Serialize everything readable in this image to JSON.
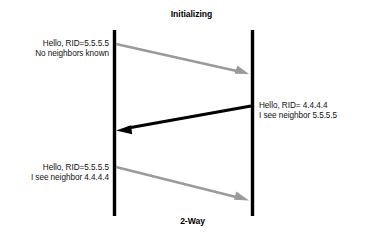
{
  "diagram": {
    "type": "sequence-diagram",
    "title_top": "Initializing",
    "title_bottom": "2-Way",
    "colors": {
      "lifeline": "#000000",
      "arrow_gray": "#9a9a9a",
      "arrow_black": "#000000",
      "background": "#ffffff",
      "text": "#111111"
    },
    "lifelines": [
      {
        "name": "left-router-lifeline",
        "x": 114,
        "y_top": 30,
        "y_bottom": 216
      },
      {
        "name": "right-router-lifeline",
        "x": 252,
        "y_top": 30,
        "y_bottom": 216
      }
    ],
    "messages": [
      {
        "id": "hello-1",
        "direction": "left-to-right",
        "color": "#9a9a9a",
        "label_lines": [
          "Hello, RID=5.5.5.5",
          "No neighbors known"
        ],
        "x1": 116,
        "y1": 44,
        "x2": 248,
        "y2": 74
      },
      {
        "id": "hello-2",
        "direction": "right-to-left",
        "color": "#000000",
        "label_lines": [
          "Hello, RID= 4.4.4.4",
          "I see neighbor 5.5.5.5"
        ],
        "x1": 251,
        "y1": 106,
        "x2": 118,
        "y2": 130
      },
      {
        "id": "hello-3",
        "direction": "left-to-right",
        "color": "#9a9a9a",
        "label_lines": [
          "Hello, RID=5.5.5.5",
          "I see neighbor 4.4.4.4"
        ],
        "x1": 116,
        "y1": 167,
        "x2": 248,
        "y2": 200
      }
    ]
  }
}
